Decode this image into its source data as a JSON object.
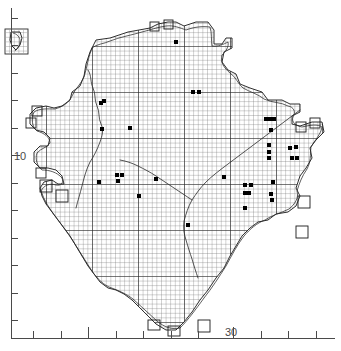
{
  "figure": {
    "kind": "distribution-atlas-map",
    "background_color": "#ffffff",
    "ink_color": "#1a1a1a",
    "grid_color": "#555555",
    "dot_color": "#000000"
  },
  "chart_data": {
    "type": "scatter",
    "title": "",
    "xlabel": "",
    "ylabel": "",
    "grid": true,
    "legend": false,
    "xlim": [
      0,
      341
    ],
    "ylim": [
      0,
      351
    ],
    "axes": {
      "left": {
        "orientation": "vertical",
        "x_px": 11,
        "y_start_px": 8,
        "y_end_px": 338,
        "tick_labels": [
          "10"
        ],
        "labelled_tick_y_px": 155,
        "tick_spacing_px": 27.5,
        "tick_count": 12,
        "major_tick_y_px": [
          155
        ],
        "tick_y_px": [
          18,
          45,
          73,
          100,
          128,
          155,
          183,
          210,
          238,
          265,
          293,
          320
        ]
      },
      "bottom": {
        "orientation": "horizontal",
        "y_px": 338,
        "x_start_px": 11,
        "x_end_px": 335,
        "tick_labels": [
          "30"
        ],
        "labelled_tick_x_px": 233,
        "tick_spacing_px": 27.5,
        "tick_count": 11,
        "major_tick_x_px": [
          88,
          233
        ],
        "tick_x_px": [
          33,
          61,
          88,
          116,
          143,
          171,
          198,
          233,
          261,
          288,
          316
        ]
      }
    },
    "grid_cells": {
      "minor_cell_px": 4.6,
      "major_cell_px": 46,
      "note": "fine 10 km grid with heavier 100 km lines"
    },
    "points": [
      {
        "x": 176,
        "y": 42
      },
      {
        "x": 104,
        "y": 101
      },
      {
        "x": 101,
        "y": 103
      },
      {
        "x": 193,
        "y": 92
      },
      {
        "x": 199,
        "y": 92
      },
      {
        "x": 102,
        "y": 129
      },
      {
        "x": 130,
        "y": 128
      },
      {
        "x": 266,
        "y": 119
      },
      {
        "x": 270,
        "y": 119
      },
      {
        "x": 274,
        "y": 119
      },
      {
        "x": 271,
        "y": 130
      },
      {
        "x": 269,
        "y": 145
      },
      {
        "x": 269,
        "y": 152
      },
      {
        "x": 269,
        "y": 158
      },
      {
        "x": 290,
        "y": 148
      },
      {
        "x": 296,
        "y": 147
      },
      {
        "x": 292,
        "y": 158
      },
      {
        "x": 297,
        "y": 158
      },
      {
        "x": 117,
        "y": 175
      },
      {
        "x": 122,
        "y": 175
      },
      {
        "x": 118,
        "y": 181
      },
      {
        "x": 99,
        "y": 182
      },
      {
        "x": 156,
        "y": 179
      },
      {
        "x": 224,
        "y": 177
      },
      {
        "x": 245,
        "y": 185
      },
      {
        "x": 251,
        "y": 185
      },
      {
        "x": 273,
        "y": 182
      },
      {
        "x": 245,
        "y": 193
      },
      {
        "x": 249,
        "y": 193
      },
      {
        "x": 271,
        "y": 194
      },
      {
        "x": 272,
        "y": 200
      },
      {
        "x": 245,
        "y": 208
      },
      {
        "x": 188,
        "y": 225
      },
      {
        "x": 139,
        "y": 196
      }
    ],
    "point_count": 34,
    "point_marker": "filled-square",
    "point_size_px": 4
  },
  "inset": {
    "present": true,
    "name": "detached-region-inset",
    "x_px": 5,
    "y_px": 29,
    "width_px": 23,
    "height_px": 25
  },
  "map": {
    "outline_name": "coastline-outline",
    "internal_boundary_name": "regional-boundary-line"
  }
}
